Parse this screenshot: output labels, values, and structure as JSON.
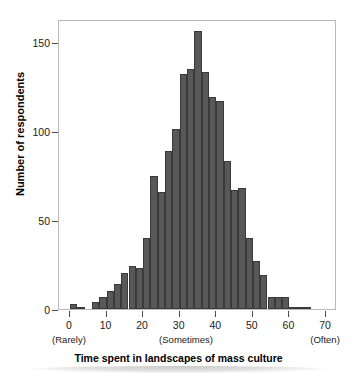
{
  "chart_data": {
    "type": "bar",
    "title": "",
    "xlabel": "Time spent in landscapes of mass culture",
    "ylabel": "Number of respondents",
    "xlim": [
      -3,
      73
    ],
    "ylim": [
      0,
      163
    ],
    "bin_width": 2,
    "grid": false,
    "legend": null,
    "bar_color": "#585858",
    "bar_edge_color": "#3a3a3a",
    "xticks": [
      0,
      10,
      20,
      30,
      40,
      50,
      60,
      70
    ],
    "xtick_labels": [
      "0",
      "10",
      "20",
      "30",
      "40",
      "50",
      "60",
      "70"
    ],
    "yticks": [
      0,
      50,
      100,
      150
    ],
    "ytick_labels": [
      "0",
      "50",
      "100",
      "150"
    ],
    "annotations": [
      {
        "x": 0,
        "text": "(Rarely)"
      },
      {
        "x": 32,
        "text": "(Sometimes)"
      },
      {
        "x": 70,
        "text": "(Often)"
      }
    ],
    "bin_centers": [
      1,
      3,
      5,
      7,
      9,
      11,
      13,
      15,
      17,
      19,
      21,
      23,
      25,
      27,
      29,
      31,
      33,
      35,
      37,
      39,
      41,
      43,
      45,
      47,
      49,
      51,
      53,
      55,
      57,
      59,
      61,
      63,
      65
    ],
    "categories": [
      "0-2",
      "2-4",
      "4-6",
      "6-8",
      "8-10",
      "10-12",
      "12-14",
      "14-16",
      "16-18",
      "18-20",
      "20-22",
      "22-24",
      "24-26",
      "26-28",
      "28-30",
      "30-32",
      "32-34",
      "34-36",
      "36-38",
      "38-40",
      "40-42",
      "42-44",
      "44-46",
      "46-48",
      "48-50",
      "50-52",
      "52-54",
      "54-56",
      "56-58",
      "58-60",
      "60-62",
      "62-64",
      "64-66"
    ],
    "values": [
      3,
      1,
      0,
      4,
      7,
      10,
      14,
      20,
      24,
      23,
      40,
      75,
      66,
      89,
      101,
      132,
      135,
      156,
      133,
      119,
      117,
      83,
      67,
      68,
      40,
      27,
      19,
      7,
      7,
      7,
      1,
      1,
      1
    ]
  }
}
